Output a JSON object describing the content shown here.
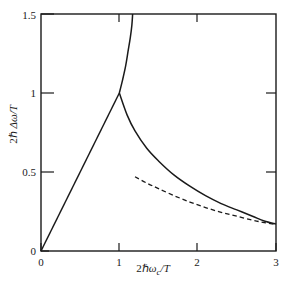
{
  "chart_data": {
    "type": "line",
    "title": "",
    "xlabel": "2ℏωc/T",
    "ylabel": "2ℏ Δω/T",
    "xlim": [
      0,
      3
    ],
    "ylim": [
      0,
      1.5
    ],
    "xticks": [
      0,
      1,
      2,
      3
    ],
    "xticklabels": [
      "0",
      "1",
      "2",
      "3"
    ],
    "yticks": [
      0,
      0.5,
      1,
      1.5
    ],
    "yticklabels": [
      "0",
      "0.5",
      "1",
      "1.5"
    ],
    "grid": false,
    "legend": null,
    "frame": "box",
    "series": [
      {
        "name": "linear-branch",
        "style": "solid",
        "points": [
          [
            0.0,
            0.0
          ],
          [
            0.2,
            0.2
          ],
          [
            0.4,
            0.4
          ],
          [
            0.6,
            0.6
          ],
          [
            0.8,
            0.8
          ],
          [
            1.0,
            1.0
          ]
        ]
      },
      {
        "name": "upper-branch",
        "style": "solid",
        "points": [
          [
            1.0,
            1.0
          ],
          [
            1.04,
            1.08
          ],
          [
            1.08,
            1.17
          ],
          [
            1.11,
            1.26
          ],
          [
            1.14,
            1.35
          ],
          [
            1.16,
            1.43
          ],
          [
            1.17,
            1.5
          ]
        ]
      },
      {
        "name": "lower-branch",
        "style": "solid",
        "points": [
          [
            1.0,
            1.0
          ],
          [
            1.1,
            0.86
          ],
          [
            1.2,
            0.76
          ],
          [
            1.35,
            0.65
          ],
          [
            1.5,
            0.57
          ],
          [
            1.7,
            0.48
          ],
          [
            1.9,
            0.41
          ],
          [
            2.1,
            0.35
          ],
          [
            2.3,
            0.3
          ],
          [
            2.5,
            0.26
          ],
          [
            2.7,
            0.22
          ],
          [
            2.85,
            0.19
          ],
          [
            3.0,
            0.17
          ]
        ]
      },
      {
        "name": "asymptotic-branch",
        "style": "dashed",
        "points": [
          [
            1.2,
            0.47
          ],
          [
            1.35,
            0.43
          ],
          [
            1.5,
            0.395
          ],
          [
            1.7,
            0.35
          ],
          [
            1.9,
            0.31
          ],
          [
            2.1,
            0.275
          ],
          [
            2.3,
            0.245
          ],
          [
            2.5,
            0.22
          ],
          [
            2.7,
            0.195
          ],
          [
            2.85,
            0.18
          ],
          [
            3.0,
            0.168
          ]
        ]
      }
    ]
  },
  "axis_label_parts": {
    "y_prefix": "2ℏ ",
    "y_main": "Δω/T",
    "x_prefix": "2ℏ",
    "x_omega": "ω",
    "x_sub": "c",
    "x_suffix": "/T"
  }
}
